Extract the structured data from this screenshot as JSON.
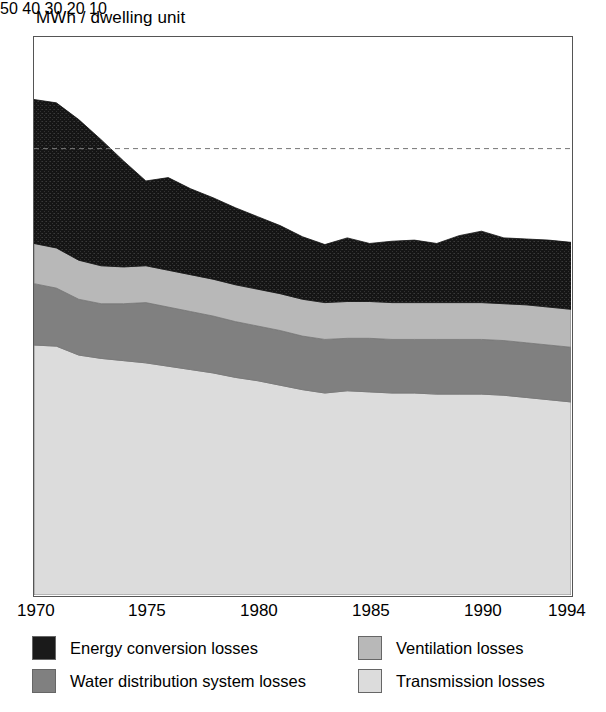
{
  "chart_data": {
    "type": "area",
    "title": "MWh / dwelling unit",
    "xlabel": "",
    "ylabel": "MWh / dwelling unit",
    "xlim": [
      1970,
      1994
    ],
    "ylim": [
      0,
      50
    ],
    "yticks": [
      50,
      40,
      30,
      20,
      10
    ],
    "xticks": [
      1970,
      1975,
      1980,
      1985,
      1990,
      1994
    ],
    "grid": false,
    "legend_position": "bottom",
    "stacked": true,
    "annotations": [
      {
        "type": "dashed-hline",
        "y": 40,
        "label": ""
      }
    ],
    "x": [
      1970,
      1971,
      1972,
      1973,
      1974,
      1975,
      1976,
      1977,
      1978,
      1979,
      1980,
      1981,
      1982,
      1983,
      1984,
      1985,
      1986,
      1987,
      1988,
      1989,
      1990,
      1991,
      1992,
      1993,
      1994
    ],
    "series": [
      {
        "name": "Transmission losses",
        "color": "#dcdcdc",
        "values": [
          22.4,
          22.3,
          21.5,
          21.2,
          21.0,
          20.8,
          20.5,
          20.2,
          19.9,
          19.5,
          19.2,
          18.8,
          18.4,
          18.1,
          18.3,
          18.2,
          18.1,
          18.1,
          18.0,
          18.0,
          18.0,
          17.9,
          17.7,
          17.5,
          17.3
        ]
      },
      {
        "name": "Water distribution system losses",
        "color": "#808080",
        "values": [
          5.5,
          5.2,
          5.0,
          4.9,
          5.1,
          5.4,
          5.3,
          5.2,
          5.1,
          5.0,
          4.9,
          4.9,
          4.8,
          4.8,
          4.7,
          4.8,
          4.8,
          4.8,
          4.9,
          4.9,
          4.9,
          4.9,
          4.9,
          4.9,
          4.9
        ]
      },
      {
        "name": "Ventilation losses",
        "color": "#b8b8b8",
        "values": [
          3.6,
          3.6,
          3.5,
          3.4,
          3.3,
          3.3,
          3.3,
          3.3,
          3.3,
          3.3,
          3.3,
          3.3,
          3.3,
          3.3,
          3.3,
          3.3,
          3.3,
          3.3,
          3.3,
          3.3,
          3.3,
          3.3,
          3.4,
          3.4,
          3.4
        ]
      },
      {
        "name": "Energy conversion losses",
        "color": "#1a1a1a",
        "values": [
          12.9,
          13.0,
          12.6,
          11.3,
          9.5,
          7.6,
          8.3,
          7.7,
          7.3,
          6.9,
          6.5,
          6.1,
          5.6,
          5.2,
          5.7,
          5.2,
          5.5,
          5.6,
          5.3,
          6.0,
          6.4,
          5.9,
          5.9,
          6.0,
          6.0
        ]
      }
    ],
    "stack_tops": {
      "transmission": [
        22.4,
        22.3,
        21.5,
        21.2,
        21.0,
        20.8,
        20.5,
        20.2,
        19.9,
        19.5,
        19.2,
        18.8,
        18.4,
        18.1,
        18.3,
        18.2,
        18.1,
        18.1,
        18.0,
        18.0,
        18.0,
        17.9,
        17.7,
        17.5,
        17.3
      ],
      "water": [
        27.9,
        27.5,
        26.5,
        26.1,
        26.1,
        26.2,
        25.8,
        25.4,
        25.0,
        24.5,
        24.1,
        23.7,
        23.2,
        22.9,
        23.0,
        23.0,
        22.9,
        22.9,
        22.9,
        22.9,
        22.9,
        22.8,
        22.6,
        22.4,
        22.2
      ],
      "ventilation": [
        31.5,
        31.1,
        30.0,
        29.5,
        29.4,
        29.5,
        29.1,
        28.7,
        28.3,
        27.8,
        27.4,
        27.0,
        26.5,
        26.2,
        26.3,
        26.3,
        26.2,
        26.2,
        26.2,
        26.2,
        26.2,
        26.1,
        26.0,
        25.8,
        25.6
      ],
      "energy": [
        44.4,
        44.1,
        42.6,
        40.8,
        38.9,
        37.1,
        37.4,
        36.4,
        35.6,
        34.7,
        33.9,
        33.1,
        32.1,
        31.4,
        32.0,
        31.5,
        31.7,
        31.8,
        31.5,
        32.2,
        32.6,
        32.0,
        31.9,
        31.8,
        31.6
      ]
    }
  },
  "yticks": {
    "t0": "50",
    "t1": "40",
    "t2": "30",
    "t3": "20",
    "t4": "10"
  },
  "xticks": {
    "t0": "1970",
    "t1": "1975",
    "t2": "1980",
    "t3": "1985",
    "t4": "1990",
    "t5": "1994"
  },
  "legend": {
    "items": [
      {
        "label": "Energy conversion losses",
        "color": "#1a1a1a"
      },
      {
        "label": "Ventilation losses",
        "color": "#b8b8b8"
      },
      {
        "label": "Water distribution system losses",
        "color": "#808080"
      },
      {
        "label": "Transmission losses",
        "color": "#dcdcdc"
      }
    ]
  }
}
